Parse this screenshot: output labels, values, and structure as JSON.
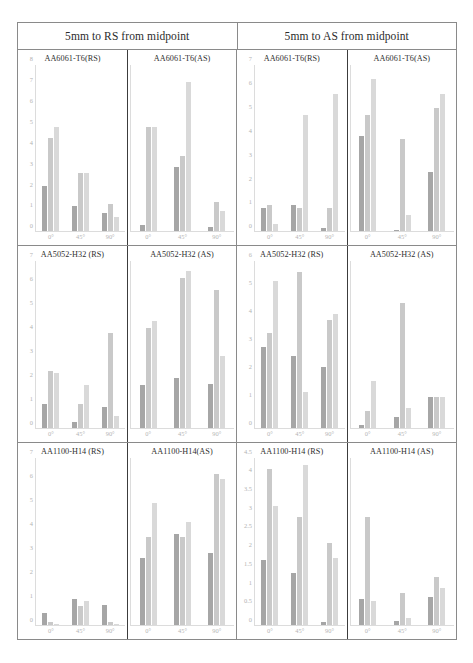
{
  "figure": {
    "headers": [
      "5mm to RS from midpoint",
      "5mm to AS from midpoint"
    ]
  },
  "colors": {
    "series1": "#a6a6a6",
    "series2": "#c9c9c9",
    "series3": "#d9d9d9",
    "axis_text": "#b3b3b3",
    "title_text": "#2f2f2f",
    "frame": "#8a8a8a",
    "divider": "#3c3c3c"
  },
  "chart_data": [
    {
      "id": "r1p1",
      "type": "bar",
      "title": "AA6061-T6(RS)",
      "row": 1,
      "col": 1,
      "header_group": "5mm to RS from midpoint",
      "categories": [
        "0°",
        "45°",
        "90°"
      ],
      "series": [
        {
          "name": "series1",
          "values": [
            2.2,
            1.2,
            0.9
          ]
        },
        {
          "name": "series2",
          "values": [
            4.5,
            2.8,
            1.3
          ]
        },
        {
          "name": "series3",
          "values": [
            5.0,
            2.8,
            0.7
          ]
        }
      ],
      "ylim": [
        0,
        8
      ],
      "yticks": [
        0,
        1,
        2,
        3,
        4,
        5,
        6,
        7,
        8
      ],
      "show_yaxis": true,
      "xlabel": "",
      "ylabel": "",
      "grid": false,
      "legend": "none"
    },
    {
      "id": "r1p2",
      "type": "bar",
      "title": "AA6061-T6(AS)",
      "row": 1,
      "col": 2,
      "header_group": "5mm to RS from midpoint",
      "categories": [
        "0°",
        "45°",
        "90°"
      ],
      "series": [
        {
          "name": "series1",
          "values": [
            0.3,
            3.1,
            0.2
          ]
        },
        {
          "name": "series2",
          "values": [
            5.0,
            3.6,
            1.4
          ]
        },
        {
          "name": "series3",
          "values": [
            5.0,
            7.2,
            1.0
          ]
        }
      ],
      "ylim": [
        0,
        8
      ],
      "yticks": [
        0,
        1,
        2,
        3,
        4,
        5,
        6,
        7,
        8
      ],
      "show_yaxis": false,
      "xlabel": "",
      "ylabel": "",
      "grid": false,
      "legend": "none"
    },
    {
      "id": "r1p3",
      "type": "bar",
      "title": "AA6061-T6(RS)",
      "row": 1,
      "col": 3,
      "header_group": "5mm to AS from midpoint",
      "categories": [
        "0°",
        "45°",
        "90°"
      ],
      "series": [
        {
          "name": "series1",
          "values": [
            1.0,
            1.1,
            0.15
          ]
        },
        {
          "name": "series2",
          "values": [
            1.1,
            1.0,
            1.0
          ]
        },
        {
          "name": "series3",
          "values": [
            0.3,
            4.9,
            5.8
          ]
        }
      ],
      "ylim": [
        0,
        7
      ],
      "yticks": [
        0,
        1,
        2,
        3,
        4,
        5,
        6,
        7
      ],
      "show_yaxis": true,
      "xlabel": "",
      "ylabel": "",
      "grid": false,
      "legend": "none"
    },
    {
      "id": "r1p4",
      "type": "bar",
      "title": "AA6061-T6(AS)",
      "row": 1,
      "col": 4,
      "header_group": "5mm to AS from midpoint",
      "categories": [
        "0°",
        "45°",
        "90°"
      ],
      "series": [
        {
          "name": "series1",
          "values": [
            4.0,
            0.05,
            2.5
          ]
        },
        {
          "name": "series2",
          "values": [
            4.9,
            3.9,
            5.2
          ]
        },
        {
          "name": "series3",
          "values": [
            6.4,
            0.7,
            5.8
          ]
        }
      ],
      "ylim": [
        0,
        7
      ],
      "yticks": [
        0,
        1,
        2,
        3,
        4,
        5,
        6,
        7
      ],
      "show_yaxis": false,
      "xlabel": "",
      "ylabel": "",
      "grid": false,
      "legend": "none"
    },
    {
      "id": "r2p1",
      "type": "bar",
      "title": "AA5052-H32 (RS)",
      "row": 2,
      "col": 1,
      "header_group": "5mm to RS from midpoint",
      "categories": [
        "0°",
        "45°",
        "90°"
      ],
      "series": [
        {
          "name": "series1",
          "values": [
            1.0,
            0.25,
            0.85
          ]
        },
        {
          "name": "series2",
          "values": [
            2.4,
            1.0,
            4.0
          ]
        },
        {
          "name": "series3",
          "values": [
            2.3,
            1.8,
            0.5
          ]
        }
      ],
      "ylim": [
        0,
        7
      ],
      "yticks": [
        0,
        1,
        2,
        3,
        4,
        5,
        6,
        7
      ],
      "show_yaxis": true,
      "xlabel": "",
      "ylabel": "",
      "grid": false,
      "legend": "none"
    },
    {
      "id": "r2p2",
      "type": "bar",
      "title": "AA5052-H32 (AS)",
      "row": 2,
      "col": 2,
      "header_group": "5mm to RS from midpoint",
      "categories": [
        "0°",
        "45°",
        "90°"
      ],
      "series": [
        {
          "name": "series1",
          "values": [
            1.8,
            2.1,
            1.85
          ]
        },
        {
          "name": "series2",
          "values": [
            4.2,
            6.3,
            5.8
          ]
        },
        {
          "name": "series3",
          "values": [
            4.5,
            6.6,
            3.0
          ]
        }
      ],
      "ylim": [
        0,
        7
      ],
      "yticks": [
        0,
        1,
        2,
        3,
        4,
        5,
        6,
        7
      ],
      "show_yaxis": false,
      "xlabel": "",
      "ylabel": "",
      "grid": false,
      "legend": "none"
    },
    {
      "id": "r2p3",
      "type": "bar",
      "title": "AA5052-H32 (RS)",
      "row": 2,
      "col": 3,
      "header_group": "5mm to AS from midpoint",
      "categories": [
        "0°",
        "45°",
        "90°"
      ],
      "series": [
        {
          "name": "series1",
          "values": [
            2.9,
            2.6,
            2.2
          ]
        },
        {
          "name": "series2",
          "values": [
            3.4,
            5.6,
            3.9
          ]
        },
        {
          "name": "series3",
          "values": [
            5.3,
            1.3,
            4.1
          ]
        }
      ],
      "ylim": [
        0,
        6
      ],
      "yticks": [
        0,
        1,
        2,
        3,
        4,
        5,
        6
      ],
      "show_yaxis": true,
      "xlabel": "",
      "ylabel": "",
      "grid": false,
      "legend": "none"
    },
    {
      "id": "r2p4",
      "type": "bar",
      "title": "AA5052-H32 (AS)",
      "row": 2,
      "col": 4,
      "header_group": "5mm to AS from midpoint",
      "categories": [
        "0°",
        "45°",
        "90°"
      ],
      "series": [
        {
          "name": "series1",
          "values": [
            0.08,
            0.4,
            1.1
          ]
        },
        {
          "name": "series2",
          "values": [
            0.6,
            4.5,
            1.1
          ]
        },
        {
          "name": "series3",
          "values": [
            1.7,
            0.7,
            1.1
          ]
        }
      ],
      "ylim": [
        0,
        6
      ],
      "yticks": [
        0,
        1,
        2,
        3,
        4,
        5,
        6
      ],
      "show_yaxis": false,
      "xlabel": "",
      "ylabel": "",
      "grid": false,
      "legend": "none"
    },
    {
      "id": "r3p1",
      "type": "bar",
      "title": "AA1100-H14 (RS)",
      "row": 3,
      "col": 1,
      "header_group": "5mm to RS from midpoint",
      "categories": [
        "0°",
        "45°",
        "90°"
      ],
      "series": [
        {
          "name": "series1",
          "values": [
            0.5,
            1.1,
            0.85
          ]
        },
        {
          "name": "series2",
          "values": [
            0.12,
            0.8,
            0.12
          ]
        },
        {
          "name": "series3",
          "values": [
            0.06,
            1.0,
            0.06
          ]
        }
      ],
      "ylim": [
        0,
        7
      ],
      "yticks": [
        0,
        1,
        2,
        3,
        4,
        5,
        6,
        7
      ],
      "show_yaxis": true,
      "xlabel": "",
      "ylabel": "",
      "grid": false,
      "legend": "none"
    },
    {
      "id": "r3p2",
      "type": "bar",
      "title": "AA1100-H14(AS)",
      "row": 3,
      "col": 2,
      "header_group": "5mm to RS from midpoint",
      "categories": [
        "0°",
        "45°",
        "90°"
      ],
      "series": [
        {
          "name": "series1",
          "values": [
            2.8,
            3.8,
            3.0
          ]
        },
        {
          "name": "series2",
          "values": [
            3.7,
            3.7,
            6.3
          ]
        },
        {
          "name": "series3",
          "values": [
            5.1,
            4.3,
            6.1
          ]
        }
      ],
      "ylim": [
        0,
        7
      ],
      "yticks": [
        0,
        1,
        2,
        3,
        4,
        5,
        6,
        7
      ],
      "show_yaxis": false,
      "xlabel": "",
      "ylabel": "",
      "grid": false,
      "legend": "none"
    },
    {
      "id": "r3p3",
      "type": "bar",
      "title": "AA1100-H14 (RS)",
      "row": 3,
      "col": 3,
      "header_group": "5mm to AS from midpoint",
      "categories": [
        "0°",
        "45°",
        "90°"
      ],
      "series": [
        {
          "name": "series1",
          "values": [
            1.75,
            1.4,
            0.08
          ]
        },
        {
          "name": "series2",
          "values": [
            4.2,
            2.9,
            2.2
          ]
        },
        {
          "name": "series3",
          "values": [
            3.2,
            4.3,
            1.8
          ]
        }
      ],
      "ylim": [
        0,
        4.5
      ],
      "yticks": [
        0,
        0.5,
        1,
        1.5,
        2,
        2.5,
        3,
        3.5,
        4,
        4.5
      ],
      "show_yaxis": true,
      "xlabel": "",
      "ylabel": "",
      "grid": false,
      "legend": "none"
    },
    {
      "id": "r3p4",
      "type": "bar",
      "title": "AA1100-H14 (AS)",
      "row": 3,
      "col": 4,
      "header_group": "5mm to AS from midpoint",
      "categories": [
        "0°",
        "45°",
        "90°"
      ],
      "series": [
        {
          "name": "series1",
          "values": [
            0.7,
            0.1,
            0.75
          ]
        },
        {
          "name": "series2",
          "values": [
            2.9,
            0.85,
            1.3
          ]
        },
        {
          "name": "series3",
          "values": [
            0.65,
            0.2,
            1.0
          ]
        }
      ],
      "ylim": [
        0,
        4.5
      ],
      "yticks": [
        0,
        0.5,
        1,
        1.5,
        2,
        2.5,
        3,
        3.5,
        4,
        4.5
      ],
      "show_yaxis": false,
      "xlabel": "",
      "ylabel": "",
      "grid": false,
      "legend": "none"
    }
  ]
}
